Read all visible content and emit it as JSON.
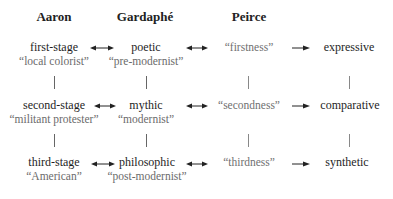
{
  "headers": {
    "aaron": "Aaron",
    "gardaphe": "Gardaphé",
    "peirce": "Peirce"
  },
  "rows": [
    {
      "aaron": {
        "term": "first-stage",
        "label": "“local colorist”"
      },
      "gardaphe": {
        "term": "poetic",
        "label": "“pre-modernist”"
      },
      "peirce": "“firstness”",
      "result": "expressive"
    },
    {
      "aaron": {
        "term": "second-stage",
        "label": "“militant protester”"
      },
      "gardaphe": {
        "term": "mythic",
        "label": "“modernist”"
      },
      "peirce": "“secondness”",
      "result": "comparative"
    },
    {
      "aaron": {
        "term": "third-stage",
        "label": "“American”"
      },
      "gardaphe": {
        "term": "philosophic",
        "label": "“post-modernist”"
      },
      "peirce": "“thirdness”",
      "result": "synthetic"
    }
  ],
  "connectors": {
    "aaron_gardaphe": "double-arrow",
    "gardaphe_peirce": "double-arrow",
    "peirce_result": "right-arrow",
    "vertical": "line"
  }
}
